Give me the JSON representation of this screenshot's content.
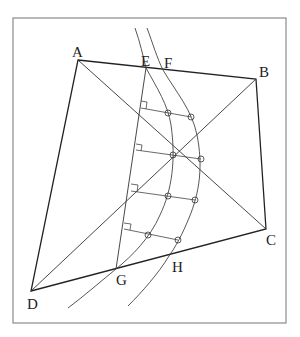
{
  "figure": {
    "labels": {
      "A": "A",
      "B": "B",
      "C": "C",
      "D": "D",
      "E": "E",
      "F": "F",
      "G": "G",
      "H": "H"
    },
    "points": {
      "A": [
        78,
        60
      ],
      "B": [
        256,
        79
      ],
      "C": [
        266,
        229
      ],
      "D": [
        31,
        291
      ],
      "E": [
        146,
        68
      ],
      "F": [
        163,
        70
      ],
      "G": [
        116,
        269
      ],
      "H": [
        169,
        256
      ]
    },
    "colors": {
      "line": "#222222",
      "frame": "#8a8a8a",
      "background": "#ffffff"
    },
    "offsets": [
      {
        "foot": [
          141,
          108
        ],
        "on_arc1": [
          168,
          113
        ],
        "on_arc2": [
          191,
          117
        ]
      },
      {
        "foot": [
          137,
          148
        ],
        "on_arc1": [
          173,
          155
        ],
        "on_arc2": [
          201,
          158
        ]
      },
      {
        "foot": [
          132,
          191
        ],
        "on_arc1": [
          168,
          195
        ],
        "on_arc2": [
          195,
          200
        ]
      },
      {
        "foot": [
          126,
          228
        ],
        "on_arc1": [
          148,
          235
        ],
        "on_arc2": [
          178,
          240
        ]
      }
    ]
  }
}
